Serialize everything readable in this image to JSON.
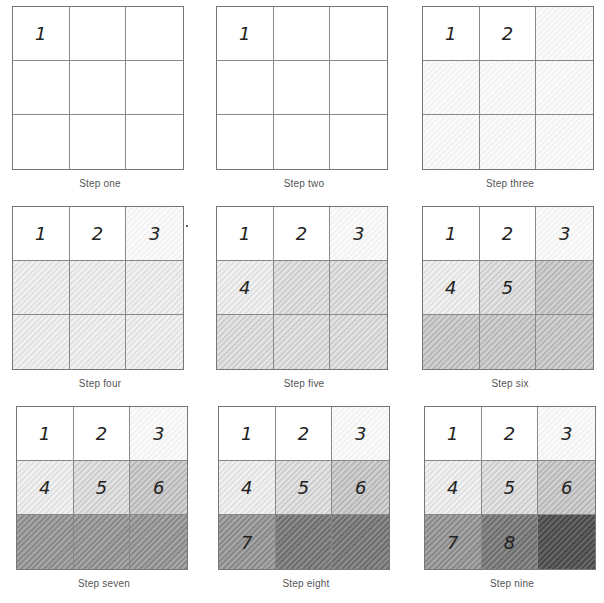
{
  "document": {
    "subject": "Pencil value scale in nine steps",
    "panels": [
      {
        "caption": "Step one",
        "cells": [
          {
            "label": "1",
            "shade": 0
          },
          {
            "label": "",
            "shade": 0
          },
          {
            "label": "",
            "shade": 0
          },
          {
            "label": "",
            "shade": 0
          },
          {
            "label": "",
            "shade": 0
          },
          {
            "label": "",
            "shade": 0
          },
          {
            "label": "",
            "shade": 0
          },
          {
            "label": "",
            "shade": 0
          },
          {
            "label": "",
            "shade": 0
          }
        ]
      },
      {
        "caption": "Step two",
        "cells": [
          {
            "label": "1",
            "shade": 0
          },
          {
            "label": "",
            "shade": 0
          },
          {
            "label": "",
            "shade": 0
          },
          {
            "label": "",
            "shade": 0
          },
          {
            "label": "",
            "shade": 0
          },
          {
            "label": "",
            "shade": 0
          },
          {
            "label": "",
            "shade": 0
          },
          {
            "label": "",
            "shade": 0
          },
          {
            "label": "",
            "shade": 0
          }
        ]
      },
      {
        "caption": "Step three",
        "cells": [
          {
            "label": "1",
            "shade": 0
          },
          {
            "label": "2",
            "shade": 0
          },
          {
            "label": "",
            "shade": 1
          },
          {
            "label": "",
            "shade": 1
          },
          {
            "label": "",
            "shade": 1
          },
          {
            "label": "",
            "shade": 1
          },
          {
            "label": "",
            "shade": 1
          },
          {
            "label": "",
            "shade": 1
          },
          {
            "label": "",
            "shade": 1
          }
        ]
      },
      {
        "caption": "Step four",
        "cells": [
          {
            "label": "1",
            "shade": 0
          },
          {
            "label": "2",
            "shade": 0
          },
          {
            "label": "3",
            "shade": 1
          },
          {
            "label": "",
            "shade": 2
          },
          {
            "label": "",
            "shade": 2
          },
          {
            "label": "",
            "shade": 2
          },
          {
            "label": "",
            "shade": 2
          },
          {
            "label": "",
            "shade": 2
          },
          {
            "label": "",
            "shade": 2
          }
        ]
      },
      {
        "caption": "Step five",
        "cells": [
          {
            "label": "1",
            "shade": 0
          },
          {
            "label": "2",
            "shade": 0
          },
          {
            "label": "3",
            "shade": 1
          },
          {
            "label": "4",
            "shade": 2
          },
          {
            "label": "",
            "shade": 3
          },
          {
            "label": "",
            "shade": 3
          },
          {
            "label": "",
            "shade": 3
          },
          {
            "label": "",
            "shade": 3
          },
          {
            "label": "",
            "shade": 3
          }
        ]
      },
      {
        "caption": "Step six",
        "cells": [
          {
            "label": "1",
            "shade": 0
          },
          {
            "label": "2",
            "shade": 0
          },
          {
            "label": "3",
            "shade": 1
          },
          {
            "label": "4",
            "shade": 2
          },
          {
            "label": "5",
            "shade": 3
          },
          {
            "label": "",
            "shade": 4
          },
          {
            "label": "",
            "shade": 4
          },
          {
            "label": "",
            "shade": 4
          },
          {
            "label": "",
            "shade": 4
          }
        ]
      },
      {
        "caption": "Step seven",
        "cells": [
          {
            "label": "1",
            "shade": 0
          },
          {
            "label": "2",
            "shade": 0
          },
          {
            "label": "3",
            "shade": 1
          },
          {
            "label": "4",
            "shade": 2
          },
          {
            "label": "5",
            "shade": 3
          },
          {
            "label": "6",
            "shade": 4
          },
          {
            "label": "",
            "shade": 6
          },
          {
            "label": "",
            "shade": 6
          },
          {
            "label": "",
            "shade": 6
          }
        ]
      },
      {
        "caption": "Step eight",
        "cells": [
          {
            "label": "1",
            "shade": 0
          },
          {
            "label": "2",
            "shade": 0
          },
          {
            "label": "3",
            "shade": 1
          },
          {
            "label": "4",
            "shade": 2
          },
          {
            "label": "5",
            "shade": 3
          },
          {
            "label": "6",
            "shade": 4
          },
          {
            "label": "7",
            "shade": 6
          },
          {
            "label": "",
            "shade": 7
          },
          {
            "label": "",
            "shade": 7
          }
        ]
      },
      {
        "caption": "Step nine",
        "cells": [
          {
            "label": "1",
            "shade": 0
          },
          {
            "label": "2",
            "shade": 0
          },
          {
            "label": "3",
            "shade": 1
          },
          {
            "label": "4",
            "shade": 2
          },
          {
            "label": "5",
            "shade": 3
          },
          {
            "label": "6",
            "shade": 4
          },
          {
            "label": "7",
            "shade": 6
          },
          {
            "label": "8",
            "shade": 7
          },
          {
            "label": "",
            "shade": 8
          }
        ]
      }
    ],
    "positions": [
      {
        "left": 12,
        "top": 6
      },
      {
        "left": 216,
        "top": 6
      },
      {
        "left": 422,
        "top": 6
      },
      {
        "left": 12,
        "top": 206
      },
      {
        "left": 216,
        "top": 206
      },
      {
        "left": 422,
        "top": 206
      },
      {
        "left": 16,
        "top": 406
      },
      {
        "left": 218,
        "top": 406
      },
      {
        "left": 424,
        "top": 406
      }
    ]
  }
}
